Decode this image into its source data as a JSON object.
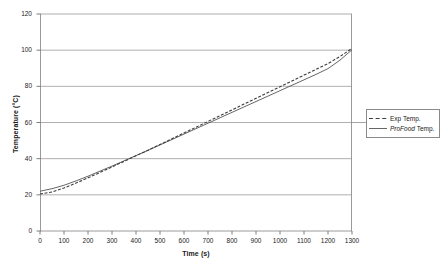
{
  "chart_data": {
    "type": "line",
    "title": "",
    "xlabel": "Time (s)",
    "ylabel": "Temperature (°C)",
    "xlim": [
      0,
      1300
    ],
    "ylim": [
      0,
      120
    ],
    "xticks": [
      0,
      100,
      200,
      300,
      400,
      500,
      600,
      700,
      800,
      900,
      1000,
      1100,
      1200,
      1300
    ],
    "yticks": [
      0,
      20,
      40,
      60,
      80,
      100,
      120
    ],
    "grid": "horizontal",
    "legend_position": "right",
    "colors": {
      "exp_temp": "#404040",
      "profood_temp": "#555555",
      "grid": "#999999",
      "axis": "#808080",
      "legend_border": "#8a8a8a",
      "background": "#ffffff"
    },
    "series": [
      {
        "name": "Exp Temp.",
        "style": "dashed",
        "x": [
          0,
          50,
          100,
          150,
          200,
          250,
          300,
          350,
          400,
          450,
          500,
          550,
          600,
          650,
          700,
          750,
          800,
          850,
          900,
          950,
          1000,
          1050,
          1100,
          1150,
          1200,
          1250,
          1300
        ],
        "y": [
          20.5,
          21.6,
          23.8,
          26.5,
          29.4,
          32.4,
          35.4,
          38.5,
          41.6,
          44.7,
          47.8,
          51.0,
          54.2,
          57.4,
          60.6,
          63.8,
          67.0,
          70.2,
          73.4,
          76.6,
          79.8,
          83.0,
          86.2,
          89.4,
          92.6,
          96.5,
          101.0
        ]
      },
      {
        "name": "ProFood Temp.",
        "name_italic_part": "ProFood",
        "name_plain_part": " Temp.",
        "style": "solid",
        "x": [
          0,
          50,
          100,
          150,
          200,
          250,
          300,
          350,
          400,
          450,
          500,
          550,
          600,
          650,
          700,
          750,
          800,
          850,
          900,
          950,
          1000,
          1050,
          1100,
          1150,
          1200,
          1250,
          1300
        ],
        "y": [
          22.0,
          23.4,
          25.3,
          27.7,
          30.3,
          33.1,
          35.9,
          38.8,
          41.7,
          44.6,
          47.6,
          50.6,
          53.6,
          56.6,
          59.6,
          62.6,
          65.6,
          68.6,
          71.6,
          74.6,
          77.6,
          80.6,
          83.6,
          86.6,
          89.8,
          94.5,
          100.2
        ]
      }
    ]
  },
  "axes": {
    "y_title": "Temperature (°C)",
    "x_title": "Time (s)",
    "y_tick_labels": [
      "0",
      "20",
      "40",
      "60",
      "80",
      "100",
      "120"
    ],
    "x_tick_labels": [
      "0",
      "100",
      "200",
      "300",
      "400",
      "500",
      "600",
      "700",
      "800",
      "900",
      "1000",
      "1100",
      "1200",
      "1300"
    ]
  },
  "legend": {
    "items": [
      {
        "label": "Exp Temp.",
        "style": "dashed"
      },
      {
        "label_italic": "ProFood",
        "label_plain": " Temp.",
        "style": "solid"
      }
    ]
  }
}
